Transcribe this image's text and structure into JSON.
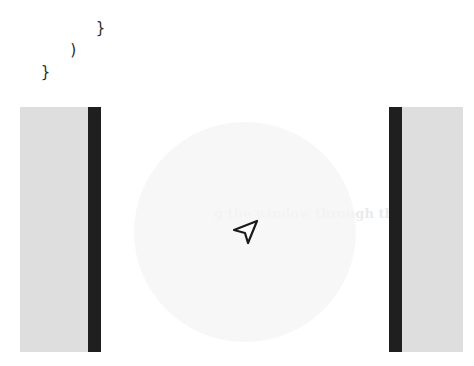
{
  "code": {
    "lines": [
      {
        "text": "}"
      },
      {
        "text": ")"
      },
      {
        "text": "}"
      }
    ]
  },
  "background_document": {
    "heading_fragment": "g the window through the",
    "paragraph_lines": [
      "",
      "",
      "",
      ""
    ]
  },
  "panels": {
    "left_color": "#dedede",
    "right_color": "#dedede",
    "bar_color": "#1f1f1f"
  },
  "cursor": {
    "icon": "send-pointer-icon",
    "position": {
      "x": 245,
      "y": 231
    }
  }
}
